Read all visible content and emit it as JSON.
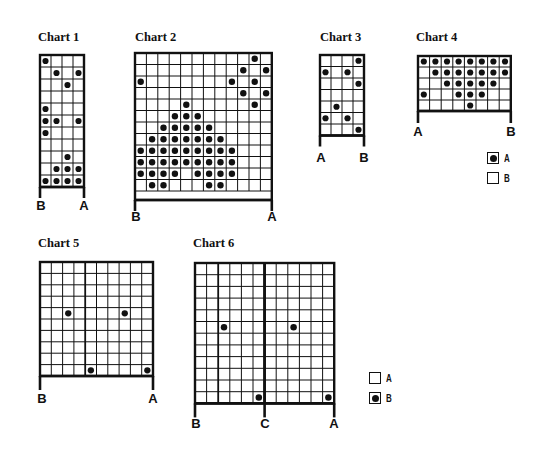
{
  "chart_data": [
    {
      "type": "table",
      "id": "chart1",
      "title": "Chart 1",
      "cols": 4,
      "rows": 11,
      "dots": [
        [
          1,
          1
        ],
        [
          2,
          2
        ],
        [
          2,
          4
        ],
        [
          3,
          3
        ],
        [
          5,
          1
        ],
        [
          6,
          1
        ],
        [
          6,
          2
        ],
        [
          6,
          4
        ],
        [
          7,
          1
        ],
        [
          9,
          3
        ],
        [
          10,
          2
        ],
        [
          10,
          3
        ],
        [
          10,
          4
        ],
        [
          11,
          1
        ],
        [
          11,
          2
        ],
        [
          11,
          3
        ],
        [
          11,
          4
        ]
      ],
      "bottom_labels": [
        {
          "text": "B",
          "col_edge": 0
        },
        {
          "text": "A",
          "col_edge": 4
        }
      ]
    },
    {
      "type": "table",
      "id": "chart2",
      "title": "Chart 2",
      "cols": 12,
      "rows": 12,
      "dots": [
        [
          1,
          11
        ],
        [
          2,
          10
        ],
        [
          2,
          12
        ],
        [
          3,
          1
        ],
        [
          3,
          9
        ],
        [
          3,
          11
        ],
        [
          4,
          10
        ],
        [
          4,
          12
        ],
        [
          5,
          5
        ],
        [
          5,
          11
        ],
        [
          6,
          4
        ],
        [
          6,
          5
        ],
        [
          6,
          6
        ],
        [
          7,
          3
        ],
        [
          7,
          4
        ],
        [
          7,
          5
        ],
        [
          7,
          6
        ],
        [
          7,
          7
        ],
        [
          8,
          2
        ],
        [
          8,
          3
        ],
        [
          8,
          4
        ],
        [
          8,
          5
        ],
        [
          8,
          6
        ],
        [
          8,
          7
        ],
        [
          8,
          8
        ],
        [
          9,
          1
        ],
        [
          9,
          2
        ],
        [
          9,
          3
        ],
        [
          9,
          4
        ],
        [
          9,
          5
        ],
        [
          9,
          6
        ],
        [
          9,
          7
        ],
        [
          9,
          8
        ],
        [
          9,
          9
        ],
        [
          10,
          1
        ],
        [
          10,
          2
        ],
        [
          10,
          3
        ],
        [
          10,
          4
        ],
        [
          10,
          5
        ],
        [
          10,
          6
        ],
        [
          10,
          7
        ],
        [
          10,
          8
        ],
        [
          10,
          9
        ],
        [
          11,
          1
        ],
        [
          11,
          2
        ],
        [
          11,
          3
        ],
        [
          11,
          4
        ],
        [
          11,
          6
        ],
        [
          11,
          7
        ],
        [
          11,
          8
        ],
        [
          11,
          9
        ],
        [
          12,
          2
        ],
        [
          12,
          3
        ],
        [
          12,
          7
        ],
        [
          12,
          8
        ]
      ],
      "bottom_labels": [
        {
          "text": "B",
          "col_edge": 0
        },
        {
          "text": "A",
          "col_edge": 12
        }
      ]
    },
    {
      "type": "table",
      "id": "chart3",
      "title": "Chart 3",
      "cols": 4,
      "rows": 7,
      "dots": [
        [
          1,
          4
        ],
        [
          2,
          1
        ],
        [
          2,
          3
        ],
        [
          3,
          4
        ],
        [
          5,
          2
        ],
        [
          6,
          1
        ],
        [
          6,
          3
        ],
        [
          7,
          4
        ]
      ],
      "bottom_labels": [
        {
          "text": "A",
          "col_edge": 0
        },
        {
          "text": "B",
          "col_edge": 4
        }
      ]
    },
    {
      "type": "table",
      "id": "chart4",
      "title": "Chart 4",
      "cols": 8,
      "rows": 5,
      "dots": [
        [
          1,
          1
        ],
        [
          1,
          2
        ],
        [
          1,
          3
        ],
        [
          1,
          4
        ],
        [
          1,
          5
        ],
        [
          1,
          6
        ],
        [
          1,
          7
        ],
        [
          1,
          8
        ],
        [
          2,
          2
        ],
        [
          2,
          3
        ],
        [
          2,
          4
        ],
        [
          2,
          5
        ],
        [
          2,
          6
        ],
        [
          2,
          7
        ],
        [
          2,
          8
        ],
        [
          3,
          3
        ],
        [
          3,
          4
        ],
        [
          3,
          5
        ],
        [
          3,
          6
        ],
        [
          3,
          7
        ],
        [
          4,
          1
        ],
        [
          4,
          4
        ],
        [
          4,
          5
        ],
        [
          4,
          6
        ],
        [
          5,
          5
        ]
      ],
      "bottom_labels": [
        {
          "text": "A",
          "col_edge": 0
        },
        {
          "text": "B",
          "col_edge": 8
        }
      ],
      "legend": [
        {
          "symbol": "dot",
          "label": "A"
        },
        {
          "symbol": "empty",
          "label": "B"
        }
      ]
    },
    {
      "type": "table",
      "id": "chart5",
      "title": "Chart 5",
      "cols": 10,
      "rows": 10,
      "dots": [
        [
          5,
          3
        ],
        [
          5,
          8
        ],
        [
          10,
          5
        ],
        [
          10,
          10
        ]
      ],
      "heavy_col_lines": [
        4
      ],
      "bottom_labels": [
        {
          "text": "B",
          "col_edge": 0
        },
        {
          "text": "A",
          "col_edge": 10
        }
      ]
    },
    {
      "type": "table",
      "id": "chart6",
      "title": "Chart 6",
      "cols": 12,
      "rows": 12,
      "dots": [
        [
          6,
          3
        ],
        [
          6,
          9
        ],
        [
          12,
          6
        ],
        [
          12,
          12
        ]
      ],
      "heavy_col_lines": [
        2,
        6
      ],
      "bottom_labels": [
        {
          "text": "B",
          "col_edge": 0
        },
        {
          "text": "C",
          "col_edge": 6
        },
        {
          "text": "A",
          "col_edge": 12
        }
      ],
      "legend": [
        {
          "symbol": "empty",
          "label": "A"
        },
        {
          "symbol": "dot",
          "label": "B"
        }
      ]
    }
  ],
  "charts": {
    "c1": {
      "title": "Chart 1",
      "label_left": "B",
      "label_right": "A"
    },
    "c2": {
      "title": "Chart 2",
      "label_left": "B",
      "label_right": "A"
    },
    "c3": {
      "title": "Chart 3",
      "label_left": "A",
      "label_right": "B"
    },
    "c4": {
      "title": "Chart 4",
      "label_left": "A",
      "label_right": "B",
      "legend_a": "A",
      "legend_b": "B"
    },
    "c5": {
      "title": "Chart 5",
      "label_left": "B",
      "label_right": "A"
    },
    "c6": {
      "title": "Chart 6",
      "label_left": "B",
      "label_mid": "C",
      "label_right": "A",
      "legend_a": "A",
      "legend_b": "B"
    }
  },
  "colors": {
    "ink": "#111111",
    "paper": "#ffffff"
  }
}
